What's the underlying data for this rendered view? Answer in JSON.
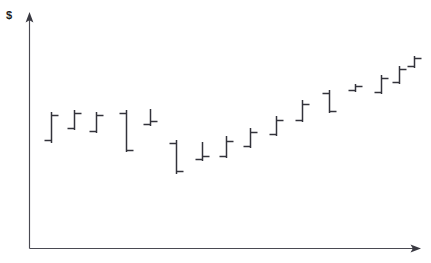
{
  "chart_data": {
    "type": "ohlc",
    "title": "",
    "subtitle": "",
    "xlabel": "",
    "ylabel": "$",
    "ylabel_symbol": "$",
    "grid": false,
    "legend": null,
    "xticks": [],
    "yticks": [],
    "xlim": [
      0,
      16
    ],
    "ylim": [
      0,
      100
    ],
    "axis_color": "#4a4a52",
    "bar_color": "#33333b",
    "background_color": "#ffffff",
    "series_name": "Price",
    "point_count": 16,
    "categories": [
      "1",
      "2",
      "3",
      "4",
      "5",
      "6",
      "7",
      "8",
      "9",
      "10",
      "11",
      "12",
      "13",
      "14",
      "15",
      "16"
    ],
    "points": [
      {
        "x": 1,
        "open": 48,
        "high": 71,
        "low": 46,
        "close": 69
      },
      {
        "x": 2,
        "open": 59,
        "high": 75,
        "low": 57,
        "close": 72
      },
      {
        "x": 3,
        "open": 55,
        "high": 73,
        "low": 53,
        "close": 71
      },
      {
        "x": 4,
        "open": 71,
        "high": 72,
        "low": 44,
        "close": 46
      },
      {
        "x": 5,
        "open": 63,
        "high": 74,
        "low": 61,
        "close": 65
      },
      {
        "x": 6,
        "open": 43,
        "high": 45,
        "low": 27,
        "close": 29
      },
      {
        "x": 7,
        "open": 36,
        "high": 43,
        "low": 33,
        "close": 35
      },
      {
        "x": 8,
        "open": 37,
        "high": 48,
        "low": 35,
        "close": 44
      },
      {
        "x": 9,
        "open": 44,
        "high": 57,
        "low": 42,
        "close": 54
      },
      {
        "x": 10,
        "open": 53,
        "high": 66,
        "low": 51,
        "close": 63
      },
      {
        "x": 11,
        "open": 59,
        "high": 77,
        "low": 57,
        "close": 74
      },
      {
        "x": 12,
        "open": 65,
        "high": 82,
        "low": 63,
        "close": 70
      },
      {
        "x": 13,
        "open": 76,
        "high": 82,
        "low": 74,
        "close": 79
      },
      {
        "x": 14,
        "open": 74,
        "high": 88,
        "low": 72,
        "close": 85
      },
      {
        "x": 15,
        "open": 79,
        "high": 92,
        "low": 77,
        "close": 90
      },
      {
        "x": 16,
        "open": 88,
        "high": 96,
        "low": 86,
        "close": 94
      }
    ],
    "geometry": {
      "note": "pixel geometry of the plotted OHLC bars as rendered",
      "y_axis_x": 29,
      "x_axis_y": 248,
      "y_axis_top": 14,
      "x_axis_right": 420,
      "bars": [
        {
          "cx": 51,
          "top": 112,
          "bottom": 143,
          "open_y": 140,
          "close_y": 115
        },
        {
          "cx": 74,
          "top": 110,
          "bottom": 130,
          "open_y": 128,
          "close_y": 113
        },
        {
          "cx": 96,
          "top": 112,
          "bottom": 133,
          "open_y": 131,
          "close_y": 115
        },
        {
          "cx": 126,
          "top": 110,
          "bottom": 152,
          "open_y": 113,
          "close_y": 150
        },
        {
          "cx": 150,
          "top": 109,
          "bottom": 126,
          "open_y": 124,
          "close_y": 121
        },
        {
          "cx": 176,
          "top": 140,
          "bottom": 174,
          "open_y": 143,
          "close_y": 171
        },
        {
          "cx": 202,
          "top": 142,
          "bottom": 161,
          "open_y": 159,
          "close_y": 156
        },
        {
          "cx": 226,
          "top": 136,
          "bottom": 158,
          "open_y": 156,
          "close_y": 141
        },
        {
          "cx": 250,
          "top": 128,
          "bottom": 148,
          "open_y": 146,
          "close_y": 132
        },
        {
          "cx": 276,
          "top": 116,
          "bottom": 136,
          "open_y": 134,
          "close_y": 120
        },
        {
          "cx": 302,
          "top": 100,
          "bottom": 122,
          "open_y": 120,
          "close_y": 104
        },
        {
          "cx": 329,
          "top": 90,
          "bottom": 113,
          "open_y": 93,
          "close_y": 111
        },
        {
          "cx": 355,
          "top": 84,
          "bottom": 92,
          "open_y": 90,
          "close_y": 86
        },
        {
          "cx": 381,
          "top": 75,
          "bottom": 94,
          "open_y": 92,
          "close_y": 78
        },
        {
          "cx": 399,
          "top": 66,
          "bottom": 84,
          "open_y": 82,
          "close_y": 69
        },
        {
          "cx": 414,
          "top": 56,
          "bottom": 68,
          "open_y": 66,
          "close_y": 58
        }
      ],
      "tick_len": 7
    }
  },
  "axes": {
    "y_label": "$",
    "x_label": ""
  }
}
